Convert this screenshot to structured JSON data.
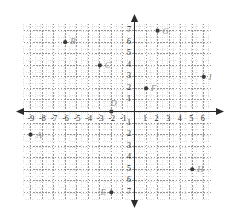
{
  "chart_data": {
    "type": "scatter",
    "title": "",
    "xlabel": "",
    "ylabel": "",
    "xlim": [
      -9.6,
      6.6
    ],
    "ylim": [
      -7.6,
      7.6
    ],
    "grid": true,
    "legend_position": "none",
    "x_ticks": [
      -9,
      -8,
      -7,
      -6,
      -5,
      -4,
      -3,
      -2,
      -1,
      1,
      2,
      3,
      4,
      5,
      6
    ],
    "y_ticks": [
      7,
      6,
      5,
      4,
      3,
      2,
      1,
      -1,
      -2,
      -3,
      -4,
      -5,
      -6,
      -7
    ],
    "x_tick_labels": [
      "-9",
      "-8",
      "-7",
      "-6",
      "-5",
      "-4",
      "-3",
      "-2",
      "-1",
      "1",
      "2",
      "3",
      "4",
      "5",
      "6"
    ],
    "y_tick_labels": [
      "7",
      "6",
      "5",
      "4",
      "3",
      "2",
      "1",
      "1",
      "2",
      "3",
      "4",
      "5",
      "6",
      "7"
    ],
    "points": [
      {
        "label": "A",
        "x": -9,
        "y": -2,
        "label_dx": 6,
        "label_dy": -4
      },
      {
        "label": "B",
        "x": -6,
        "y": 6,
        "label_dx": 5,
        "label_dy": -5
      },
      {
        "label": "C",
        "x": -3,
        "y": 4,
        "label_dx": 5,
        "label_dy": -4
      },
      {
        "label": "D",
        "x": -2,
        "y": 0,
        "label_dx": -1,
        "label_dy": -13
      },
      {
        "label": "E",
        "x": -2,
        "y": -7,
        "label_dx": -11,
        "label_dy": -4
      },
      {
        "label": "F",
        "x": 1,
        "y": 2,
        "label_dx": 5,
        "label_dy": -4
      },
      {
        "label": "G",
        "x": 2,
        "y": 7,
        "label_dx": 5,
        "label_dy": -4
      },
      {
        "label": "H",
        "x": 5,
        "y": -5,
        "label_dx": 5,
        "label_dy": -4
      },
      {
        "label": "I",
        "x": 6,
        "y": 3,
        "label_dx": 5,
        "label_dy": -4
      }
    ]
  },
  "style": {
    "axis_color": "#2b2b2b",
    "major_grid_color": "#8c8c8c",
    "minor_grid_color": "#c9c9c9",
    "point_color": "#3a3a3a",
    "label_color": "#8d8d8d",
    "tick_color": "#2b2b2b",
    "background": "#ffffff"
  }
}
